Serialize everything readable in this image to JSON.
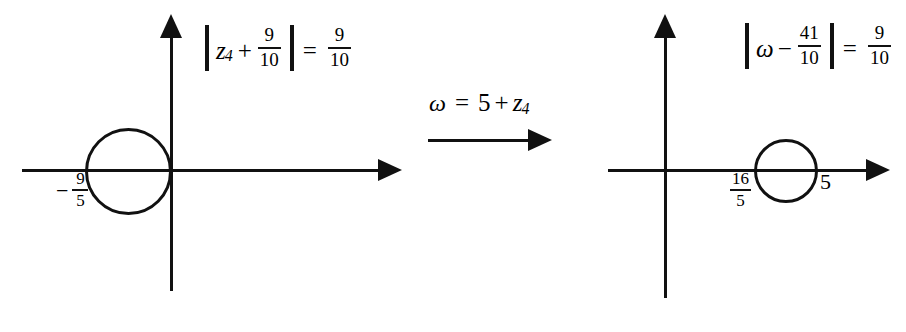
{
  "figure": {
    "background_color": "#ffffff",
    "stroke_color": "#111111"
  },
  "left_plot": {
    "name": "z-plane",
    "equation": {
      "variable": "z",
      "subscript": "4",
      "operator": "+",
      "operand": {
        "numerator": "9",
        "denominator": "10"
      },
      "equals": "=",
      "radius": {
        "numerator": "9",
        "denominator": "10"
      }
    },
    "axis_labels": [
      {
        "sign": "−",
        "numerator": "9",
        "denominator": "5",
        "value": "-9/5"
      }
    ],
    "circle": {
      "center_x": "-9/10",
      "center_y": "0",
      "radius": "9/10"
    }
  },
  "transform": {
    "variable": "ω",
    "equals": "=",
    "constant": "5",
    "operator": "+",
    "term": "z",
    "term_subscript": "4",
    "expression": "ω = 5 + z4",
    "arrow": "right-arrow"
  },
  "right_plot": {
    "name": "w-plane",
    "equation": {
      "variable": "ω",
      "operator": "−",
      "operand": {
        "numerator": "41",
        "denominator": "10"
      },
      "equals": "=",
      "radius": {
        "numerator": "9",
        "denominator": "10"
      }
    },
    "axis_labels": [
      {
        "numerator": "16",
        "denominator": "5",
        "value": "16/5"
      },
      {
        "value": "5"
      }
    ],
    "circle": {
      "center_x": "41/10",
      "center_y": "0",
      "radius": "9/10"
    }
  }
}
